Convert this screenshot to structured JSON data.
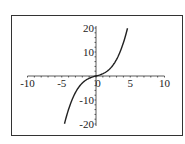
{
  "chart_data": {
    "type": "line",
    "title": "",
    "xlabel": "",
    "ylabel": "",
    "xlim": [
      -10,
      10
    ],
    "ylim": [
      -20,
      20
    ],
    "grid": false,
    "legend": null,
    "x_ticks": [
      -10,
      -5,
      0,
      5,
      10
    ],
    "y_ticks": [
      -20,
      -10,
      10,
      20
    ],
    "x_tick_labels": [
      "-10",
      "-5",
      "0",
      "5",
      "10"
    ],
    "y_tick_labels": [
      "-20",
      "-10",
      "10",
      "20"
    ],
    "series": [
      {
        "name": "curve",
        "color": "#222222",
        "x": [
          -4.6,
          -4,
          -3,
          -2,
          -1,
          0,
          1,
          2,
          3,
          4,
          4.6
        ],
        "y": [
          -19.9,
          -13.9,
          -6.9,
          -2.9,
          -1.0,
          0,
          1.0,
          2.9,
          6.9,
          13.9,
          19.9
        ]
      }
    ]
  },
  "frame": {
    "border_color": "#333333",
    "axis_color": "#333333"
  }
}
